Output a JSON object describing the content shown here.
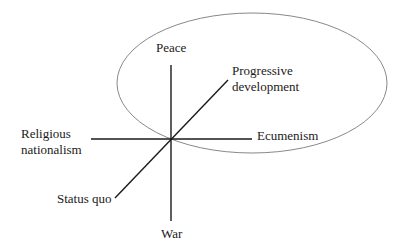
{
  "diagram": {
    "type": "three-axis conceptual diagram with enclosing ellipse",
    "axes": {
      "vertical": {
        "top": "Peace",
        "bottom": "War"
      },
      "horizontal": {
        "left_line1": "Religious",
        "left_line2": "nationalism",
        "right": "Ecumenism"
      },
      "diagonal": {
        "upper_line1": "Progressive",
        "upper_line2": "development",
        "lower": "Status quo"
      }
    },
    "ellipse": {
      "encloses": [
        "Peace",
        "Progressive development",
        "Ecumenism"
      ]
    },
    "colors": {
      "line": "#1a1a1a",
      "ellipse": "#7a7a7a",
      "background": "#ffffff"
    }
  }
}
